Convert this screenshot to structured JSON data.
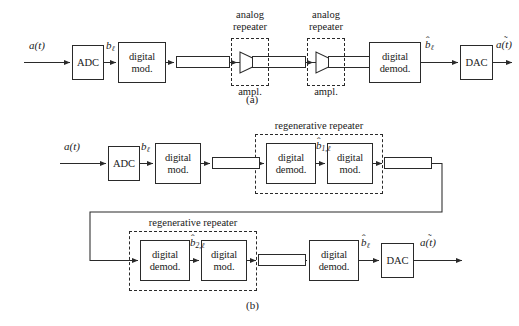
{
  "figure": {
    "panels": [
      {
        "id": "a",
        "caption": "(a)",
        "caption_x": 238,
        "caption_y": 99
      },
      {
        "id": "b",
        "caption": "(b)",
        "caption_y": 305,
        "caption_x": 238
      }
    ]
  },
  "panel_a": {
    "caption": "(a)",
    "signals": {
      "input": "a(t)",
      "after_adc": "b",
      "after_adc_sub": "ℓ",
      "after_demod": "b",
      "after_demod_sub": "ℓ",
      "output": "a(t)"
    },
    "blocks": [
      {
        "name": "adc",
        "label": "ADC",
        "x": 72,
        "y": 45,
        "w": 32,
        "h": 35
      },
      {
        "name": "digital-mod",
        "label_line1": "digital",
        "label_line2": "mod.",
        "x": 118,
        "y": 42,
        "w": 48,
        "h": 41
      },
      {
        "name": "digital-demod",
        "label_line1": "digital",
        "label_line2": "demod.",
        "x": 369,
        "y": 42,
        "w": 52,
        "h": 41
      },
      {
        "name": "dac",
        "label": "DAC",
        "x": 460,
        "y": 45,
        "w": 33,
        "h": 35
      }
    ],
    "channels": [
      {
        "name": "channel-1",
        "x": 176,
        "y": 56,
        "w": 54,
        "h": 12
      },
      {
        "name": "channel-2",
        "x": 252,
        "y": 56,
        "w": 54,
        "h": 12
      },
      {
        "name": "channel-3",
        "x": 328,
        "y": 56,
        "w": 54,
        "h": 12
      }
    ],
    "repeaters": [
      {
        "name": "analog-repeater-1",
        "title_line1": "analog",
        "title_line2": "repeater",
        "sublabel": "ampl.",
        "box_x": 231,
        "box_y": 38,
        "box_w": 38,
        "box_h": 48,
        "title_x": 250,
        "title_y": 11,
        "sublabel_x": 250,
        "sublabel_y": 86
      },
      {
        "name": "analog-repeater-2",
        "title_line1": "analog",
        "title_line2": "repeater",
        "sublabel": "ampl.",
        "box_x": 307,
        "box_y": 38,
        "box_w": 38,
        "box_h": 48,
        "title_x": 326,
        "title_y": 11,
        "sublabel_x": 326,
        "sublabel_y": 86
      }
    ]
  },
  "panel_b": {
    "caption": "(b)",
    "signals": {
      "input": "a(t)",
      "after_adc": "b",
      "after_adc_sub": "ℓ",
      "repeater1_mid": "b",
      "repeater1_mid_sub": "1,ℓ",
      "repeater2_mid": "b",
      "repeater2_mid_sub": "2,ℓ",
      "after_demod": "b",
      "after_demod_sub": "ℓ",
      "output": "a(t)"
    },
    "blocks": [
      {
        "name": "adc",
        "label": "ADC",
        "x": 108,
        "y": 146,
        "w": 32,
        "h": 35
      },
      {
        "name": "digital-mod-tx",
        "label_line1": "digital",
        "label_line2": "mod.",
        "x": 155,
        "y": 143,
        "w": 46,
        "h": 41
      },
      {
        "name": "repeater1-demod",
        "label_line1": "digital",
        "label_line2": "demod.",
        "x": 266,
        "y": 143,
        "w": 50,
        "h": 41
      },
      {
        "name": "repeater1-mod",
        "label_line1": "digital",
        "label_line2": "mod.",
        "x": 327,
        "y": 143,
        "w": 46,
        "h": 41
      },
      {
        "name": "repeater2-demod",
        "label_line1": "digital",
        "label_line2": "demod.",
        "x": 140,
        "y": 240,
        "w": 50,
        "h": 41
      },
      {
        "name": "repeater2-mod",
        "label_line1": "digital",
        "label_line2": "mod.",
        "x": 201,
        "y": 240,
        "w": 46,
        "h": 41
      },
      {
        "name": "digital-demod-rx",
        "label_line1": "digital",
        "label_line2": "demod.",
        "x": 309,
        "y": 240,
        "w": 50,
        "h": 41
      },
      {
        "name": "dac",
        "label": "DAC",
        "x": 381,
        "y": 243,
        "w": 33,
        "h": 35
      }
    ],
    "channels": [
      {
        "name": "channel-1",
        "x": 212,
        "y": 157,
        "w": 48,
        "h": 12
      },
      {
        "name": "channel-2",
        "x": 384,
        "y": 157,
        "w": 48,
        "h": 12
      },
      {
        "name": "channel-3",
        "x": 258,
        "y": 254,
        "w": 48,
        "h": 12
      }
    ],
    "repeaters": [
      {
        "name": "regenerative-repeater-1",
        "title": "regenerative repeater",
        "box_x": 255,
        "box_y": 134,
        "box_w": 128,
        "box_h": 60,
        "title_x": 319,
        "title_y": 121
      },
      {
        "name": "regenerative-repeater-2",
        "title": "regenerative repeater",
        "box_x": 129,
        "box_y": 231,
        "box_w": 128,
        "box_h": 60,
        "title_x": 193,
        "title_y": 218
      }
    ]
  }
}
